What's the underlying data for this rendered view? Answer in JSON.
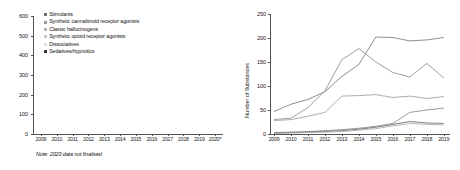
{
  "chart_data": [
    {
      "type": "bar",
      "stacked": true,
      "title": "",
      "xlabel": "",
      "ylabel": "",
      "ylim": [
        0,
        600
      ],
      "yticks": [
        0,
        100,
        200,
        300,
        400,
        500,
        600
      ],
      "categories": [
        "2009",
        "2010",
        "2011",
        "2012",
        "2013",
        "2014",
        "2015",
        "2016",
        "2017",
        "2018",
        "2019",
        "2020*"
      ],
      "grid": false,
      "legend_position": "top-left",
      "note": "Note: 2020 data not finalised",
      "series": [
        {
          "name": "Stimulants",
          "color": "#6f6f6f",
          "values": [
            92,
            120,
            156,
            200,
            300,
            320,
            350,
            335,
            312,
            330,
            318,
            140
          ]
        },
        {
          "name": "Synthetic cannabinoid receptor agonists",
          "color": "#9a9a9a",
          "values": [
            8,
            12,
            18,
            22,
            72,
            62,
            70,
            74,
            88,
            92,
            96,
            18
          ]
        },
        {
          "name": "Classic hallucinogens",
          "color": "#b5b5b5",
          "values": [
            6,
            6,
            8,
            12,
            22,
            24,
            30,
            28,
            40,
            45,
            38,
            8
          ]
        },
        {
          "name": "Synthetic opioid receptor agonists",
          "color": "#c9c9c9",
          "values": [
            2,
            2,
            3,
            4,
            8,
            10,
            12,
            10,
            14,
            16,
            14,
            4
          ]
        },
        {
          "name": "Dissociatives",
          "color": "#dcdcdc",
          "values": [
            2,
            2,
            3,
            3,
            6,
            6,
            8,
            6,
            8,
            10,
            8,
            3
          ]
        },
        {
          "name": "Sedatives/hypnotics",
          "color": "#3a3a3a",
          "values": [
            0,
            2,
            4,
            6,
            10,
            12,
            14,
            12,
            14,
            16,
            14,
            3
          ]
        }
      ]
    },
    {
      "type": "line",
      "title": "",
      "xlabel": "",
      "ylabel": "Number of Substances",
      "ylim": [
        0,
        250
      ],
      "yticks": [
        0,
        50,
        100,
        150,
        200,
        250
      ],
      "x": [
        "2009",
        "2010",
        "2011",
        "2012",
        "2013",
        "2014",
        "2015",
        "2016",
        "2017",
        "2018",
        "2019"
      ],
      "grid": false,
      "series": [
        {
          "name": "series-1",
          "color": "#7a7a7a",
          "values": [
            47,
            62,
            72,
            88,
            120,
            145,
            202,
            201,
            194,
            196,
            201
          ]
        },
        {
          "name": "series-2",
          "color": "#8c8c8c",
          "values": [
            30,
            33,
            55,
            90,
            155,
            178,
            150,
            128,
            119,
            147,
            117
          ]
        },
        {
          "name": "series-3",
          "color": "#9e9e9e",
          "values": [
            28,
            30,
            37,
            45,
            79,
            80,
            82,
            76,
            79,
            74,
            78
          ]
        },
        {
          "name": "series-4",
          "color": "#8a8a8a",
          "values": [
            3,
            4,
            5,
            7,
            9,
            12,
            16,
            22,
            45,
            50,
            54
          ]
        },
        {
          "name": "series-5",
          "color": "#6a6a6a",
          "values": [
            2,
            3,
            4,
            5,
            7,
            10,
            14,
            20,
            26,
            23,
            22
          ]
        },
        {
          "name": "series-6",
          "color": "#aaaaaa",
          "values": [
            1,
            2,
            3,
            4,
            5,
            8,
            11,
            17,
            22,
            20,
            19
          ]
        }
      ]
    }
  ],
  "left": {
    "legend": [
      {
        "label": "Stimulants"
      },
      {
        "label": "Synthetic cannabinoid receptor agonists"
      },
      {
        "label": "Classic hallucinogens"
      },
      {
        "label": "Synthetic opioid receptor agonists"
      },
      {
        "label": "Dissociatives"
      },
      {
        "label": "Sedatives/hypnotics"
      }
    ],
    "note": "Note: 2020 data not finalised"
  },
  "right": {
    "y_axis_title": "Number of Substances"
  }
}
